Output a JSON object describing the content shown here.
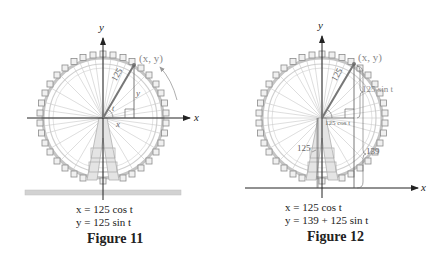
{
  "figures": [
    {
      "id": "figure-11",
      "caption": "Figure 11",
      "equations": [
        "x = 125 cos t",
        "y = 125 sin t"
      ],
      "labels": {
        "x_axis": "x",
        "y_axis": "y",
        "point": "(x, y)",
        "radius": "125",
        "angle": "t",
        "opp_side": "y",
        "adj_side": "x"
      }
    },
    {
      "id": "figure-12",
      "caption": "Figure 12",
      "equations": [
        "x = 125 cos t",
        "y = 139 + 125 sin t"
      ],
      "labels": {
        "x_axis": "x",
        "y_axis": "y",
        "point": "(x, y)",
        "radius": "125",
        "angle": "t",
        "sin_label": "125 sin t",
        "cos_label": "125 cos t",
        "left_height": "125",
        "right_height": "139"
      }
    }
  ],
  "colors": {
    "axis": "#222222",
    "wheel": "#b8b8b8",
    "gondola": "#8a8a8a",
    "radius_line": "#777777",
    "ground": "#cfcfcf",
    "label_gray": "#8a8a8a"
  }
}
